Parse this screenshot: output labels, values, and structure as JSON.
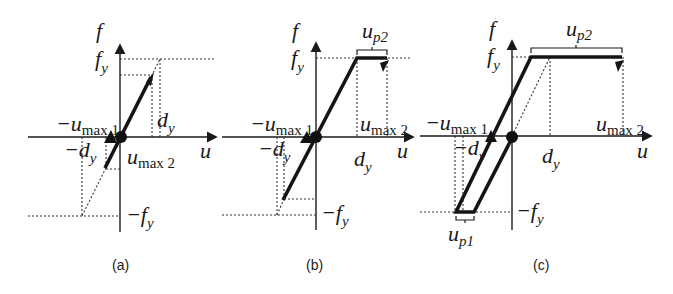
{
  "figure": {
    "panels": [
      {
        "id": "a",
        "caption": "(a)"
      },
      {
        "id": "b",
        "caption": "(b)"
      },
      {
        "id": "c",
        "caption": "(c)"
      }
    ],
    "labels": {
      "f_axis": "f",
      "u_axis": "u",
      "fy": "f",
      "fy_sub": "y",
      "neg_fy": "−f",
      "dy": "d",
      "dy_sub": "y",
      "neg_dy": "−d",
      "neg_umax1": "−u",
      "umax1_sub": "max 1",
      "umax2": "u",
      "umax2_sub": "max 2",
      "up2": "u",
      "up2_sub": "p2",
      "up1": "u",
      "up1_sub": "p1"
    }
  }
}
